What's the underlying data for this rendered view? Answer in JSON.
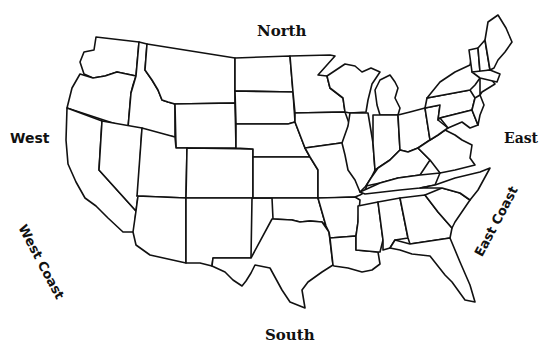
{
  "map": {
    "title": "United States outline map",
    "fill_color": "#ffffff",
    "stroke_color": "#111111",
    "background": "#ffffff"
  },
  "labels": {
    "north": "North",
    "south": "South",
    "west": "West",
    "east": "East",
    "west_coast": "West Coast",
    "east_coast": "East Coast"
  },
  "states": [
    {
      "id": "WA",
      "d": "M96,37 L139,42 L136,76 L117,72 L105,76 L93,78 L84,74 L80,62 L84,52 L94,50 Z"
    },
    {
      "id": "OR",
      "d": "M80,74 L93,78 L105,76 L117,72 L136,76 L133,85 L131,93 L128,128 L67,108 L72,88 Z"
    },
    {
      "id": "CA",
      "d": "M67,108 L102,121 L99,170 L136,211 L134,232 L123,232 L108,218 L96,206 L85,198 L76,182 L68,164 L66,140 Z"
    },
    {
      "id": "ID",
      "d": "M139,42 L147,44 L145,70 L152,80 L158,90 L162,100 L168,102 L175,104 L175,137 L128,128 L131,93 L136,76 Z"
    },
    {
      "id": "NV",
      "d": "M102,121 L142,128 L138,196 L136,211 L99,170 Z"
    },
    {
      "id": "MT",
      "d": "M147,44 L235,58 L235,103 L175,104 L168,102 L162,100 L158,90 L152,80 L145,70 Z"
    },
    {
      "id": "WY",
      "d": "M175,104 L235,103 L236,148 L176,148 Z"
    },
    {
      "id": "UT",
      "d": "M142,128 L175,137 L176,148 L187,148 L186,198 L137,196 Z"
    },
    {
      "id": "AZ",
      "d": "M137,196 L186,198 L186,263 L150,255 L136,245 L133,232 L136,211 L138,196 Z"
    },
    {
      "id": "CO",
      "d": "M187,148 L253,149 L253,198 L186,198 Z"
    },
    {
      "id": "NM",
      "d": "M186,198 L252,198 L251,258 L213,258 L212,266 L200,263 L186,263 Z"
    },
    {
      "id": "ND",
      "d": "M235,58 L290,56 L293,92 L235,91 Z"
    },
    {
      "id": "SD",
      "d": "M235,91 L293,92 L295,122 L288,124 L236,124 Z"
    },
    {
      "id": "NE",
      "d": "M236,124 L288,124 L295,122 L305,148 L310,157 L253,157 L253,149 L236,148 Z"
    },
    {
      "id": "KS",
      "d": "M253,157 L310,157 L318,170 L318,198 L253,198 Z"
    },
    {
      "id": "OK",
      "d": "M253,198 L318,198 L326,226 L322,222 L310,221 L300,222 L292,220 L273,219 L272,198 Z"
    },
    {
      "id": "TX",
      "d": "M212,266 L213,258 L251,258 L272,219 L273,219 L292,220 L300,222 L310,221 L322,222 L329,232 L333,265 L322,272 L308,282 L302,290 L305,308 L290,302 L282,290 L270,268 L255,265 L251,273 L246,281 L242,286 L233,280 L225,272 Z"
    },
    {
      "id": "MN",
      "d": "M290,56 L330,55 L335,56 L318,75 L327,76 L330,88 L343,98 L345,112 L295,113 L293,92 Z"
    },
    {
      "id": "IA",
      "d": "M295,113 L345,112 L350,126 L348,142 L312,147 L305,148 L295,122 Z"
    },
    {
      "id": "MO",
      "d": "M305,148 L348,142 L352,158 L358,170 L368,180 L365,192 L360,195 L355,197 L328,198 L318,198 L318,170 L310,157 Z"
    },
    {
      "id": "AR",
      "d": "M318,198 L355,197 L360,200 L358,222 L356,236 L330,238 L329,232 L326,226 Z"
    },
    {
      "id": "LA",
      "d": "M330,238 L356,236 L356,250 L378,252 L380,264 L372,270 L362,272 L348,268 L334,266 L333,265 Z"
    },
    {
      "id": "WI",
      "d": "M330,88 L327,76 L345,64 L355,66 L362,72 L371,68 L380,72 L372,84 L368,100 L366,112 L350,113 L345,112 L343,98 Z"
    },
    {
      "id": "IL",
      "d": "M350,113 L368,113 L373,143 L375,170 L371,178 L366,186 L360,192 L355,180 L348,170 L345,155 L342,143 L348,126 Z"
    },
    {
      "id": "MI",
      "d": "M377,105 L375,90 L380,80 L390,75 L395,82 L398,88 L395,98 L400,108 L398,115 L380,115 Z"
    },
    {
      "id": "IN",
      "d": "M373,115 L398,115 L400,150 L390,160 L378,168 L375,170 L373,143 Z"
    },
    {
      "id": "OH",
      "d": "M398,115 L410,112 L425,108 L430,140 L418,148 L408,152 L400,150 Z"
    },
    {
      "id": "KY",
      "d": "M366,186 L371,178 L378,168 L390,160 L400,150 L408,152 L418,148 L430,160 L420,175 L398,178 L380,183 Z"
    },
    {
      "id": "TN",
      "d": "M360,192 L380,183 L398,178 L420,175 L440,173 L435,185 L420,188 L400,190 L365,194 Z"
    },
    {
      "id": "MS",
      "d": "M358,206 L378,202 L383,240 L380,252 L378,252 L356,250 L356,236 L358,222 Z"
    },
    {
      "id": "AL",
      "d": "M378,202 L400,198 L408,238 L395,240 L390,248 L383,250 L383,240 Z"
    },
    {
      "id": "GA",
      "d": "M400,198 L425,195 L438,212 L452,228 L450,238 L410,244 L408,238 Z"
    },
    {
      "id": "FL",
      "d": "M390,248 L395,240 L410,244 L450,238 L460,262 L470,285 L475,302 L465,300 L452,282 L445,275 L430,256 L412,254 L400,250 Z"
    },
    {
      "id": "SC",
      "d": "M425,195 L442,188 L460,193 L470,200 L455,222 L452,228 L438,212 Z"
    },
    {
      "id": "NC",
      "d": "M420,188 L435,185 L455,178 L480,172 L490,168 L478,190 L470,200 L460,193 L442,188 Z"
    },
    {
      "id": "VA",
      "d": "M418,148 L430,140 L438,135 L445,130 L455,135 L462,140 L472,145 L470,158 L475,165 L455,170 L440,173 L430,160 Z"
    },
    {
      "id": "WV",
      "d": "M425,108 L440,105 L438,120 L448,128 L445,130 L438,135 L430,140 Z"
    },
    {
      "id": "PA",
      "d": "M425,108 L427,98 L470,90 L475,98 L472,110 L440,118 L438,120 L440,105 Z"
    },
    {
      "id": "MD",
      "d": "M440,118 L472,110 L478,125 L470,128 L462,122 L448,128 Z"
    },
    {
      "id": "NY",
      "d": "M427,98 L440,82 L455,72 L470,65 L472,55 L480,48 L490,60 L490,78 L480,78 L475,85 L470,90 Z"
    },
    {
      "id": "NJ",
      "d": "M475,98 L480,95 L484,105 L480,115 L478,125 L472,110 Z"
    },
    {
      "id": "CT",
      "d": "M480,78 L490,78 L495,84 L482,92 L480,95 Z"
    },
    {
      "id": "VT",
      "d": "M469,50 L478,48 L480,72 L472,72 Z"
    },
    {
      "id": "NH",
      "d": "M478,48 L485,40 L490,70 L480,72 Z"
    },
    {
      "id": "MA",
      "d": "M472,72 L490,70 L500,74 L497,82 L480,78 Z"
    },
    {
      "id": "ME",
      "d": "M485,40 L488,22 L498,15 L506,28 L512,42 L505,52 L498,60 L494,68 L490,70 Z"
    }
  ]
}
